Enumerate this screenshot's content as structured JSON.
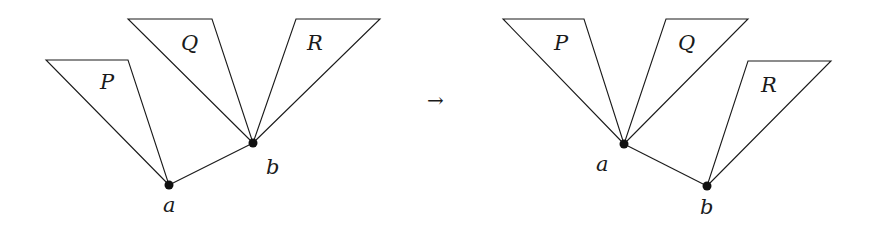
{
  "colors": {
    "stroke": "#1a1a1a",
    "vertex": "#111111",
    "background": "#ffffff"
  },
  "arrow": "→",
  "before": {
    "vertices": {
      "a": {
        "label": "a",
        "x": 169,
        "y": 185
      },
      "b": {
        "label": "b",
        "x": 253,
        "y": 143
      }
    },
    "triangles": [
      {
        "label": "P",
        "points": "46,60 128,60 169,185",
        "label_pos": [
          100,
          88
        ]
      },
      {
        "label": "Q",
        "points": "128,19 212,19 253,143",
        "label_pos": [
          181,
          48
        ]
      },
      {
        "label": "R",
        "points": "296,19 380,19 253,143",
        "label_pos": [
          307,
          48
        ]
      }
    ]
  },
  "after": {
    "vertices": {
      "a": {
        "label": "a",
        "x": 624,
        "y": 144
      },
      "b": {
        "label": "b",
        "x": 707,
        "y": 186
      }
    },
    "triangles": [
      {
        "label": "P",
        "points": "503,19 584,19 624,144",
        "label_pos": [
          554,
          48
        ]
      },
      {
        "label": "Q",
        "points": "666,19 748,19 624,144",
        "label_pos": [
          678,
          48
        ]
      },
      {
        "label": "R",
        "points": "748,61 831,61 707,186",
        "label_pos": [
          761,
          90
        ]
      }
    ]
  }
}
